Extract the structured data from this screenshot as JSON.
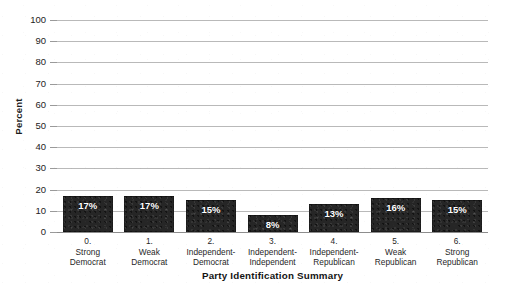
{
  "chart_data": {
    "type": "bar",
    "title": "",
    "xlabel": "Party Identification Summary",
    "ylabel": "Percent",
    "ylim": [
      0,
      100
    ],
    "ytick_step": 10,
    "yticks": [
      100,
      90,
      80,
      70,
      60,
      50,
      40,
      30,
      20,
      10,
      0
    ],
    "grid": true,
    "legend": "none",
    "categories": [
      "0. Strong Democrat",
      "1. Weak Democrat",
      "2. Independent-Democrat",
      "3. Independent-Independent",
      "4. Independent-Republican",
      "5. Weak Republican",
      "6. Strong Republican"
    ],
    "category_lines": [
      [
        "0.",
        "Strong",
        "Democrat"
      ],
      [
        "1.",
        "Weak",
        "Democrat"
      ],
      [
        "2.",
        "Independent-",
        "Democrat"
      ],
      [
        "3.",
        "Independent-",
        "Independent"
      ],
      [
        "4.",
        "Independent-",
        "Republican"
      ],
      [
        "5.",
        "Weak",
        "Republican"
      ],
      [
        "6.",
        "Strong",
        "Republican"
      ]
    ],
    "values": [
      17,
      17,
      15,
      8,
      13,
      16,
      15
    ],
    "data_labels": [
      "17%",
      "17%",
      "15%",
      "8%",
      "13%",
      "16%",
      "15%"
    ],
    "bar_color": "#262626",
    "gridline_color": "#b9b9b9",
    "data_label_color": "#ffffff",
    "background_color": "#ffffff"
  }
}
